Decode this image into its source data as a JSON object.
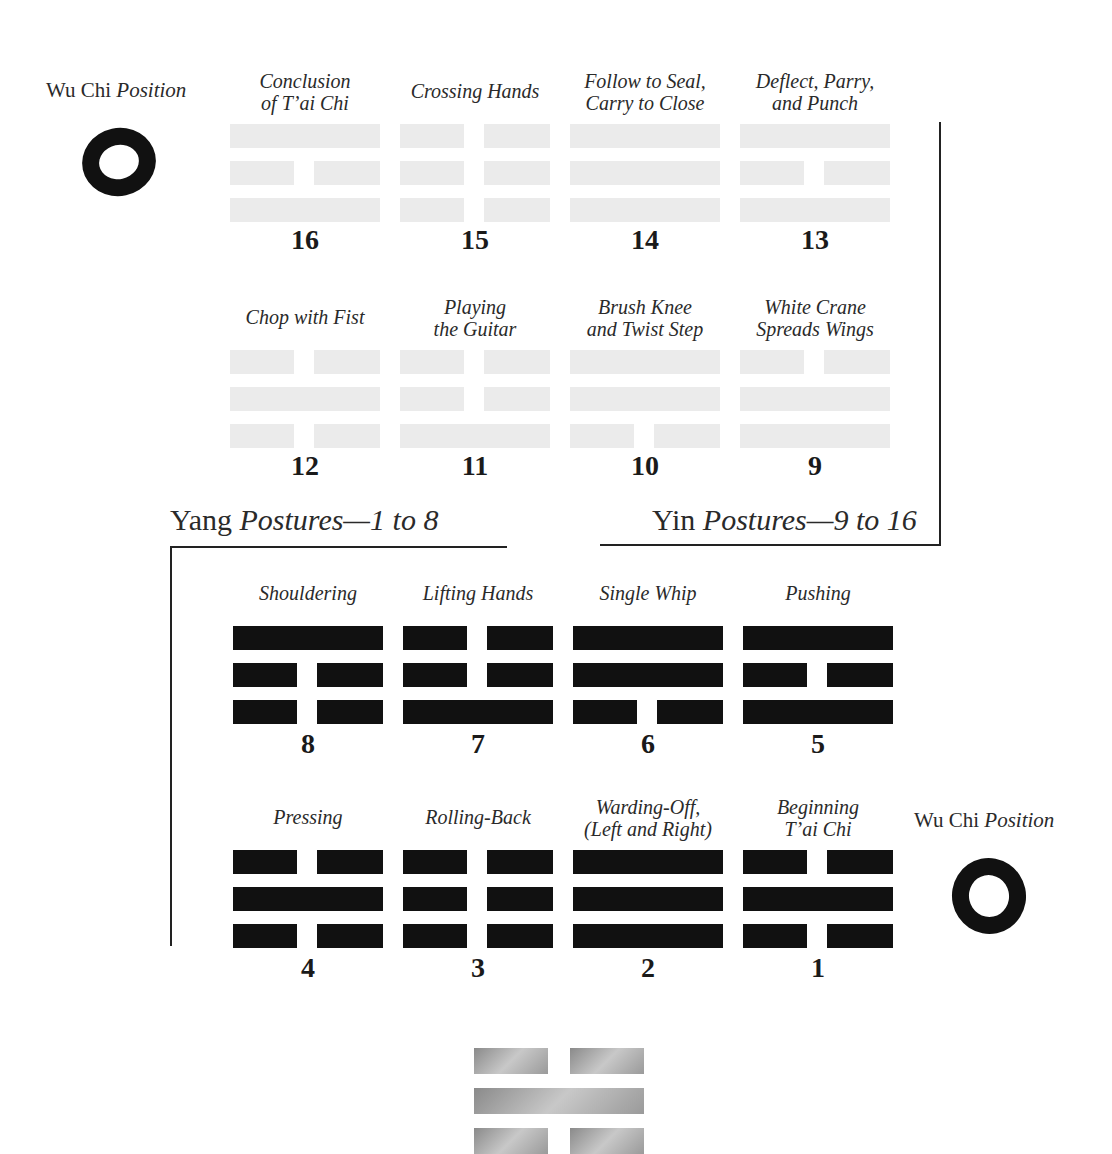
{
  "wu_chi_top": {
    "name": "Wu Chi",
    "suffix": "Position",
    "icon": "ensō-circle-icon"
  },
  "wu_chi_bottom": {
    "name": "Wu Chi",
    "suffix": "Position",
    "icon": "ensō-circle-icon"
  },
  "sections": {
    "yang": {
      "name": "Yang",
      "subtitle": "Postures—1 to 8"
    },
    "yin": {
      "name": "Yin",
      "subtitle": "Postures—9 to 16"
    }
  },
  "yin_postures": [
    {
      "number": "16",
      "label": "Conclusion\nof T’ai Chi",
      "lines": [
        "yang",
        "yin",
        "yang"
      ]
    },
    {
      "number": "15",
      "label": "Crossing Hands",
      "lines": [
        "yin",
        "yin",
        "yin"
      ]
    },
    {
      "number": "14",
      "label": "Follow to Seal,\nCarry to Close",
      "lines": [
        "yang",
        "yang",
        "yang"
      ]
    },
    {
      "number": "13",
      "label": "Deflect, Parry,\nand Punch",
      "lines": [
        "yang",
        "yin",
        "yang"
      ]
    },
    {
      "number": "12",
      "label": "Chop with Fist",
      "lines": [
        "yin",
        "yang",
        "yin"
      ]
    },
    {
      "number": "11",
      "label": "Playing\nthe Guitar",
      "lines": [
        "yin",
        "yin",
        "yang"
      ]
    },
    {
      "number": "10",
      "label": "Brush Knee\nand Twist Step",
      "lines": [
        "yang",
        "yang",
        "yin"
      ]
    },
    {
      "number": "9",
      "label": "White Crane\nSpreads Wings",
      "lines": [
        "yin",
        "yang",
        "yang"
      ]
    }
  ],
  "yang_postures": [
    {
      "number": "8",
      "label": "Shouldering",
      "lines": [
        "yang",
        "yin",
        "yin"
      ]
    },
    {
      "number": "7",
      "label": "Lifting Hands",
      "lines": [
        "yin",
        "yin",
        "yang"
      ]
    },
    {
      "number": "6",
      "label": "Single Whip",
      "lines": [
        "yang",
        "yang",
        "yin"
      ]
    },
    {
      "number": "5",
      "label": "Pushing",
      "lines": [
        "yang",
        "yin",
        "yang"
      ]
    },
    {
      "number": "4",
      "label": "Pressing",
      "lines": [
        "yin",
        "yang",
        "yin"
      ]
    },
    {
      "number": "3",
      "label": "Rolling-Back",
      "lines": [
        "yin",
        "yin",
        "yin"
      ]
    },
    {
      "number": "2",
      "label": "Warding-Off,\n(Left and Right)",
      "lines": [
        "yang",
        "yang",
        "yang"
      ]
    },
    {
      "number": "1",
      "label": "Beginning\nT’ai Chi",
      "lines": [
        "yin",
        "yang",
        "yin"
      ]
    }
  ],
  "bottom_trigram": {
    "lines": [
      "yin",
      "yang",
      "yin"
    ]
  },
  "colors": {
    "yang_ink": "#111111",
    "yin_faded": "#ebebeb",
    "rule": "#222222"
  }
}
